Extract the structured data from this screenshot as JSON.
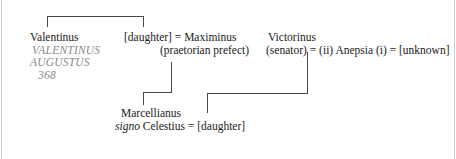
{
  "diagram": {
    "type": "family-tree",
    "people": {
      "valentinus": {
        "name": "Valentinus",
        "title_line1": "VALENTINUS",
        "title_line2": "AUGUSTUS",
        "year": "368"
      },
      "maximinus": {
        "line": "[daughter] = Maximinus",
        "role": "(praetorian prefect)"
      },
      "victorinus": {
        "name": "Victorinus",
        "line": "(senator) = (ii) Anepsia (i) = [unknown]"
      },
      "marcellianus": {
        "name": "Marcellianus",
        "signo": "signo",
        "line_rest": " Celestius = [daughter]"
      }
    },
    "colors": {
      "text": "#1a1a1a",
      "roman_title": "#8a8a8a",
      "lines": "#4a4a4a",
      "frame": "#cfcfcf"
    }
  }
}
